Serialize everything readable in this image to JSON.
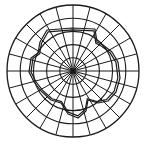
{
  "diagram": {
    "type": "polar-grid-with-outline",
    "title": "",
    "center": [
      73,
      71
    ],
    "outer_radius": 66,
    "ring_count": 5,
    "spoke_count": 24,
    "spoke_angle_deg": 15,
    "stroke_color": "#1a1a1a",
    "background_color": "#ffffff",
    "outline": {
      "description": "irregular closed double-line contour drawn over the polar grid",
      "points": [
        [
          47,
          30
        ],
        [
          72,
          28
        ],
        [
          95,
          29
        ],
        [
          97,
          42
        ],
        [
          103,
          45
        ],
        [
          112,
          52
        ],
        [
          118,
          62
        ],
        [
          120,
          78
        ],
        [
          116,
          92
        ],
        [
          108,
          101
        ],
        [
          98,
          103
        ],
        [
          88,
          100
        ],
        [
          86,
          111
        ],
        [
          78,
          118
        ],
        [
          68,
          114
        ],
        [
          61,
          103
        ],
        [
          51,
          100
        ],
        [
          41,
          91
        ],
        [
          34,
          82
        ],
        [
          29,
          72
        ],
        [
          31,
          58
        ],
        [
          38,
          53
        ],
        [
          40,
          42
        ]
      ]
    }
  }
}
